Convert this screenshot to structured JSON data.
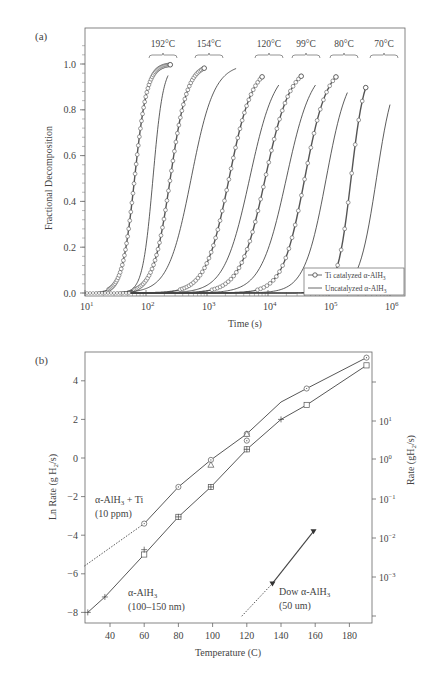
{
  "chart_data": [
    {
      "panel_label": "(a)",
      "type": "line",
      "title": "",
      "xlabel": "Time (s)",
      "ylabel": "Fractional Decomposition",
      "xscale": "log",
      "xlim": [
        10,
        1500000
      ],
      "ylim": [
        -0.02,
        1.13
      ],
      "x_tick_labels": [
        "10^1",
        "10^2",
        "10^3",
        "10^4",
        "10^5",
        "10^6"
      ],
      "y_tick_labels": [
        "0.0",
        "0.2",
        "0.4",
        "0.6",
        "0.8",
        "1.0"
      ],
      "legend": {
        "position": "lower right",
        "entries": [
          {
            "name": "Ti catalyzed α-AlH3",
            "style": "line with open circles"
          },
          {
            "name": "Uncatalyzed α-AlH3",
            "style": "solid line"
          }
        ]
      },
      "temperature_annotations": [
        "192°C",
        "154°C",
        "120°C",
        "99°C",
        "80°C",
        "70°C"
      ],
      "series": [
        {
          "name": "Ti catalyzed α-AlH3",
          "temperature": "192°C",
          "midpoint_time_s": 65,
          "t_start_s": 30,
          "t_end_s": 250
        },
        {
          "name": "Uncatalyzed α-AlH3",
          "temperature": "192°C",
          "midpoint_time_s": 130,
          "t_start_s": 40,
          "t_end_s": 230
        },
        {
          "name": "Ti catalyzed α-AlH3",
          "temperature": "154°C",
          "midpoint_time_s": 250,
          "t_start_s": 50,
          "t_end_s": 900
        },
        {
          "name": "Uncatalyzed α-AlH3",
          "temperature": "154°C",
          "midpoint_time_s": 550,
          "t_start_s": 60,
          "t_end_s": 3000
        },
        {
          "name": "Ti catalyzed α-AlH3",
          "temperature": "120°C",
          "midpoint_time_s": 2300,
          "t_start_s": 150,
          "t_end_s": 8000
        },
        {
          "name": "Uncatalyzed α-AlH3",
          "temperature": "120°C",
          "midpoint_time_s": 5000,
          "t_start_s": 200,
          "t_end_s": 15000
        },
        {
          "name": "Ti catalyzed α-AlH3",
          "temperature": "99°C",
          "midpoint_time_s": 9000,
          "t_start_s": 500,
          "t_end_s": 35000
        },
        {
          "name": "Uncatalyzed α-AlH3",
          "temperature": "99°C",
          "midpoint_time_s": 20000,
          "t_start_s": 800,
          "t_end_s": 60000
        },
        {
          "name": "Ti catalyzed α-AlH3",
          "temperature": "80°C",
          "midpoint_time_s": 40000,
          "t_start_s": 3000,
          "t_end_s": 130000
        },
        {
          "name": "Uncatalyzed α-AlH3",
          "temperature": "80°C",
          "midpoint_time_s": 90000,
          "t_start_s": 5000,
          "t_end_s": 200000
        },
        {
          "name": "Ti catalyzed α-AlH3",
          "temperature": "70°C",
          "midpoint_time_s": 230000,
          "t_start_s": 40000,
          "t_end_s": 400000
        },
        {
          "name": "Uncatalyzed α-AlH3",
          "temperature": "70°C",
          "midpoint_time_s": 600000,
          "t_start_s": 50000,
          "t_end_s": 1000000
        }
      ]
    },
    {
      "panel_label": "(b)",
      "type": "line",
      "title": "",
      "xlabel": "Temperature (C)",
      "ylabel": "Ln Rate (g H2/s)",
      "ylabel_right": "Rate (gH2/s)",
      "xlim": [
        25,
        193
      ],
      "ylim": [
        -8.3,
        5.5
      ],
      "x_tick_labels": [
        "40",
        "60",
        "80",
        "100",
        "120",
        "140",
        "160",
        "180"
      ],
      "y_tick_labels": [
        "4",
        "2",
        "0",
        "-2",
        "-4",
        "-6",
        "-8"
      ],
      "right_y_tick_labels": [
        "10^1",
        "10^0",
        "10^-1",
        "10^-2",
        "10^-3"
      ],
      "annotations": [
        "α-AlH3 + Ti (10 ppm)",
        "α-AlH3 (100–150 nm)",
        "Dow α-AlH3 (50 um)"
      ],
      "series": [
        {
          "name": "α-AlH3 + Ti (10 ppm)",
          "x": [
            60,
            80,
            99,
            120,
            140,
            155,
            190
          ],
          "y": [
            -3.4,
            -1.5,
            -0.1,
            1.25,
            2.9,
            3.6,
            5.2
          ],
          "markers": "circle-dot / triangle",
          "extrapolated_dotted": {
            "x": [
              25,
              60
            ],
            "y": [
              -5.6,
              -3.4
            ]
          }
        },
        {
          "name": "α-AlH3 (100–150 nm)",
          "x": [
            27,
            37,
            60,
            80,
            99,
            120,
            140,
            155,
            190
          ],
          "y": [
            -8.0,
            -7.2,
            -5.0,
            -3.05,
            -1.5,
            0.45,
            2.0,
            2.75,
            4.8
          ],
          "markers": "square / plus"
        },
        {
          "name": "Dow α-AlH3 (50 um)",
          "x": [
            135,
            159
          ],
          "y": [
            -6.5,
            -3.8
          ],
          "markers": "filled triangle",
          "extrapolated_dotted": {
            "x": [
              117,
              135
            ],
            "y": [
              -8.2,
              -6.5
            ]
          }
        }
      ]
    }
  ],
  "panel_a": {
    "label": "(a)",
    "ylabel": "Fractional Decomposition",
    "xlabel": "Time (s)",
    "yticks": [
      "0.0",
      "0.2",
      "0.4",
      "0.6",
      "0.8",
      "1.0"
    ],
    "xticks": [
      "10",
      "10",
      "10",
      "10",
      "10",
      "10"
    ],
    "xtick_exp": [
      "1",
      "2",
      "3",
      "4",
      "5",
      "6"
    ],
    "temps": [
      "192°C",
      "154°C",
      "120°C",
      "99°C",
      "80°C",
      "70°C"
    ],
    "legend_ti": "Ti catalyzed α-AlH",
    "legend_un": "Uncatalyzed α-AlH",
    "legend_sub": "3"
  },
  "panel_b": {
    "label": "(b)",
    "ylabel": "Ln Rate (g H",
    "ylabel_sub": "2",
    "ylabel_tail": "/s)",
    "ylabel_right": "Rate (gH",
    "ylabel_right_sub": "2",
    "ylabel_right_tail": "/s)",
    "xlabel": "Temperature (C)",
    "yticks": [
      "4",
      "2",
      "0",
      "−2",
      "−4",
      "−6",
      "−8"
    ],
    "xticks": [
      "40",
      "60",
      "80",
      "100",
      "120",
      "140",
      "160",
      "180"
    ],
    "rticks_base": "10",
    "rticks_exp": [
      "1",
      "0",
      "−1",
      "−2",
      "−3"
    ],
    "ann_ti_1": "α-AlH",
    "ann_ti_1_sub": "3",
    "ann_ti_1_tail": " + Ti",
    "ann_ti_2": "(10 ppm)",
    "ann_nano_1": "α-AlH",
    "ann_nano_1_sub": "3",
    "ann_nano_2": "(100–150 nm)",
    "ann_dow_1": "Dow α-AlH",
    "ann_dow_1_sub": "3",
    "ann_dow_2": "(50 um)"
  }
}
